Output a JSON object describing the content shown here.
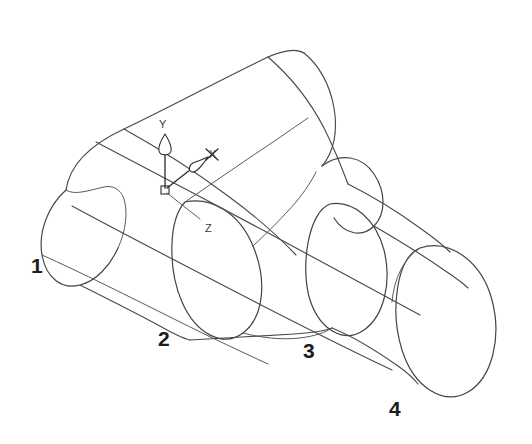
{
  "scene": {
    "title": "3D wireframe loft solid",
    "background_color": "#ffffff",
    "line_color": "#4a4a4a",
    "projection": "isometric"
  },
  "ucs": {
    "name": "ucs-axis-indicator",
    "origin_x": 165,
    "origin_y": 190,
    "axes": [
      {
        "id": "y",
        "label": "Y",
        "label_x": 162,
        "label_y": 124,
        "tip_x": 165,
        "tip_y": 135,
        "direction": "up"
      },
      {
        "id": "x",
        "label": "X",
        "label_x": 214,
        "label_y": 156,
        "tip_x": 199,
        "tip_y": 161,
        "direction": "upper-right"
      },
      {
        "id": "z",
        "label": "Z",
        "label_x": 209,
        "label_y": 230,
        "tip_x": 196,
        "tip_y": 224,
        "direction": "lower-right"
      }
    ]
  },
  "callouts": [
    {
      "id": "1",
      "text": "1",
      "x": 31,
      "y": 273,
      "section": "left-end-cap-profile"
    },
    {
      "id": "2",
      "text": "2",
      "x": 158,
      "y": 346,
      "section": "second-cross-section-profile"
    },
    {
      "id": "3",
      "text": "3",
      "x": 303,
      "y": 358,
      "section": "third-cross-section-profile"
    },
    {
      "id": "4",
      "text": "4",
      "x": 389,
      "y": 416,
      "section": "right-end-open-profile"
    }
  ],
  "geometry": {
    "description": "Lofted tube through four elliptical cross sections, narrowing at the waist and flaring to an open mouth at section 4",
    "sections": [
      {
        "index": 1,
        "kind": "rounded-cap",
        "cx": 92,
        "cy": 223,
        "rx": 30,
        "ry": 55,
        "rotation": -33
      },
      {
        "index": 2,
        "kind": "ellipse",
        "cx": 216,
        "cy": 264,
        "rx": 44,
        "ry": 78,
        "rotation": -31
      },
      {
        "index": 3,
        "kind": "ellipse",
        "cx": 347,
        "cy": 288,
        "rx": 42,
        "ry": 72,
        "rotation": -30
      },
      {
        "index": 4,
        "kind": "open-mouth-ellipse",
        "cx": 436,
        "cy": 330,
        "rx": 50,
        "ry": 82,
        "rotation": -28
      }
    ],
    "rails": 4
  }
}
